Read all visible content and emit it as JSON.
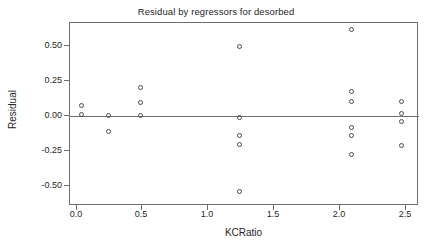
{
  "chart_data": {
    "type": "scatter",
    "title": "Residual by regressors for desorbed",
    "xlabel": "KCRatio",
    "ylabel": "Residual",
    "xlim": [
      -0.05,
      2.6
    ],
    "ylim": [
      -0.64,
      0.66
    ],
    "grid": false,
    "legend": null,
    "reference_line": {
      "orientation": "horizontal",
      "y": 0.0
    },
    "xticks": [
      "0.0",
      "0.5",
      "1.0",
      "1.5",
      "2.0",
      "2.5"
    ],
    "xtick_values": [
      0.0,
      0.5,
      1.0,
      1.5,
      2.0,
      2.5
    ],
    "yticks": [
      "0.50",
      "0.25",
      "0.00",
      "-0.25",
      "-0.50"
    ],
    "ytick_values": [
      0.5,
      0.25,
      0.0,
      -0.25,
      -0.5
    ],
    "marker": "open-circle",
    "marker_color": "#4a4a4a",
    "points": [
      {
        "x": 0.05,
        "y": 0.06
      },
      {
        "x": 0.05,
        "y": 0.0
      },
      {
        "x": 0.25,
        "y": -0.01
      },
      {
        "x": 0.25,
        "y": -0.12
      },
      {
        "x": 0.5,
        "y": 0.19
      },
      {
        "x": 0.5,
        "y": 0.085
      },
      {
        "x": 0.5,
        "y": -0.01
      },
      {
        "x": 1.25,
        "y": 0.48
      },
      {
        "x": 1.25,
        "y": -0.02
      },
      {
        "x": 1.25,
        "y": -0.15
      },
      {
        "x": 1.25,
        "y": -0.215
      },
      {
        "x": 1.25,
        "y": -0.55
      },
      {
        "x": 2.1,
        "y": 0.6
      },
      {
        "x": 2.1,
        "y": 0.165
      },
      {
        "x": 2.1,
        "y": 0.095
      },
      {
        "x": 2.1,
        "y": -0.095
      },
      {
        "x": 2.1,
        "y": -0.15
      },
      {
        "x": 2.1,
        "y": -0.285
      },
      {
        "x": 2.48,
        "y": 0.095
      },
      {
        "x": 2.48,
        "y": 0.01
      },
      {
        "x": 2.48,
        "y": -0.05
      },
      {
        "x": 2.48,
        "y": -0.22
      }
    ]
  }
}
